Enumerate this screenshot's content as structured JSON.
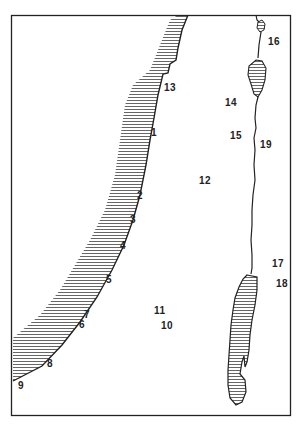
{
  "map": {
    "style": "black-and-white line drawing",
    "colors": {
      "ink": "#222222",
      "background": "#ffffff",
      "hatch": "#555555"
    },
    "features": [
      {
        "name": "coastline",
        "type": "coast-with-hatched-sea"
      },
      {
        "name": "river",
        "type": "river"
      },
      {
        "name": "small-lake-north",
        "type": "lake"
      },
      {
        "name": "lake-middle",
        "type": "lake"
      },
      {
        "name": "lake-south-large",
        "type": "lake"
      }
    ],
    "labels": [
      {
        "id": "1",
        "text": "1",
        "x": 151,
        "y": 128
      },
      {
        "id": "2",
        "text": "2",
        "x": 137,
        "y": 191
      },
      {
        "id": "3",
        "text": "3",
        "x": 130,
        "y": 215
      },
      {
        "id": "4",
        "text": "4",
        "x": 120,
        "y": 241
      },
      {
        "id": "5",
        "text": "5",
        "x": 106,
        "y": 275
      },
      {
        "id": "6",
        "text": "6",
        "x": 79,
        "y": 320
      },
      {
        "id": "7",
        "text": "7",
        "x": 84,
        "y": 310
      },
      {
        "id": "8",
        "text": "8",
        "x": 47,
        "y": 359
      },
      {
        "id": "9",
        "text": "9",
        "x": 18,
        "y": 381
      },
      {
        "id": "10",
        "text": "10",
        "x": 161,
        "y": 321
      },
      {
        "id": "11",
        "text": "11",
        "x": 154,
        "y": 306
      },
      {
        "id": "12",
        "text": "12",
        "x": 199,
        "y": 176
      },
      {
        "id": "13",
        "text": "13",
        "x": 164,
        "y": 83
      },
      {
        "id": "14",
        "text": "14",
        "x": 225,
        "y": 98
      },
      {
        "id": "15",
        "text": "15",
        "x": 230,
        "y": 131
      },
      {
        "id": "16",
        "text": "16",
        "x": 268,
        "y": 37
      },
      {
        "id": "17",
        "text": "17",
        "x": 272,
        "y": 259
      },
      {
        "id": "18",
        "text": "18",
        "x": 276,
        "y": 279
      },
      {
        "id": "19",
        "text": "19",
        "x": 260,
        "y": 140
      }
    ]
  }
}
